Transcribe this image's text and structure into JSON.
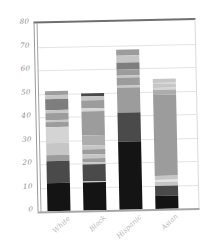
{
  "chart_data": {
    "type": "bar",
    "subtype": "stacked-bar",
    "title": "",
    "xlabel": "",
    "ylabel": "",
    "categories": [
      "White",
      "Black",
      "Hispanic",
      "Asian"
    ],
    "y_axis": {
      "min": 0,
      "max": 80,
      "tick_step": 10,
      "tick_labels": [
        "80",
        "70",
        "60",
        "50",
        "40",
        "30",
        "20",
        "10",
        "0"
      ]
    },
    "grid": true,
    "legend": false,
    "totals": [
      51.1,
      49.9,
      68.2,
      55.5
    ],
    "palette": {
      "black": "#141414",
      "darkGray": "#4a4a4a",
      "midDark": "#7e7e7e",
      "gray": "#9c9c9c",
      "lightMid": "#adadad",
      "lightGray": "#c6c6c6",
      "pale": "#d4d4d4",
      "nearWhite": "#e4e4e4"
    },
    "bars": [
      {
        "category": "White",
        "segments": [
          {
            "value": 12.0,
            "shade": "black"
          },
          {
            "value": 9.5,
            "shade": "darkGray"
          },
          {
            "value": 2.3,
            "shade": "gray"
          },
          {
            "value": 5.2,
            "shade": "lightGray"
          },
          {
            "value": 6.8,
            "shade": "pale"
          },
          {
            "value": 2.1,
            "shade": "gray"
          },
          {
            "value": 0.9,
            "shade": "lightGray"
          },
          {
            "value": 2.9,
            "shade": "gray"
          },
          {
            "value": 1.5,
            "shade": "lightGray"
          },
          {
            "value": 4.5,
            "shade": "midDark"
          },
          {
            "value": 1.7,
            "shade": "lightGray"
          },
          {
            "value": 1.7,
            "shade": "gray"
          }
        ]
      },
      {
        "category": "Black",
        "segments": [
          {
            "value": 11.9,
            "shade": "black"
          },
          {
            "value": 0.6,
            "shade": "lightGray"
          },
          {
            "value": 7.1,
            "shade": "darkGray"
          },
          {
            "value": 0.9,
            "shade": "lightGray"
          },
          {
            "value": 1.7,
            "shade": "gray"
          },
          {
            "value": 1.7,
            "shade": "lightGray"
          },
          {
            "value": 2.1,
            "shade": "gray"
          },
          {
            "value": 1.7,
            "shade": "lightGray"
          },
          {
            "value": 4.3,
            "shade": "lightMid"
          },
          {
            "value": 10.3,
            "shade": "gray"
          },
          {
            "value": 0.9,
            "shade": "pale"
          },
          {
            "value": 3.5,
            "shade": "gray"
          },
          {
            "value": 1.7,
            "shade": "lightGray"
          },
          {
            "value": 1.5,
            "shade": "darkGray"
          }
        ]
      },
      {
        "category": "Hispanic",
        "segments": [
          {
            "value": 28.8,
            "shade": "black"
          },
          {
            "value": 12.7,
            "shade": "darkGray"
          },
          {
            "value": 10.3,
            "shade": "gray"
          },
          {
            "value": 0.9,
            "shade": "lightGray"
          },
          {
            "value": 3.4,
            "shade": "gray"
          },
          {
            "value": 0.9,
            "shade": "lightGray"
          },
          {
            "value": 2.8,
            "shade": "gray"
          },
          {
            "value": 2.9,
            "shade": "midDark"
          },
          {
            "value": 2.9,
            "shade": "lightGray"
          },
          {
            "value": 2.6,
            "shade": "gray"
          }
        ]
      },
      {
        "category": "Asian",
        "segments": [
          {
            "value": 5.4,
            "shade": "black"
          },
          {
            "value": 4.3,
            "shade": "darkGray"
          },
          {
            "value": 1.7,
            "shade": "lightGray"
          },
          {
            "value": 0.9,
            "shade": "nearWhite"
          },
          {
            "value": 1.7,
            "shade": "lightGray"
          },
          {
            "value": 34.7,
            "shade": "gray"
          },
          {
            "value": 2.0,
            "shade": "lightMid"
          },
          {
            "value": 0.6,
            "shade": "pale"
          },
          {
            "value": 1.8,
            "shade": "lightGray"
          },
          {
            "value": 0.4,
            "shade": "pale"
          },
          {
            "value": 2.0,
            "shade": "lightGray"
          }
        ]
      }
    ],
    "frame_colors": {
      "top_border": "#6f6f6f",
      "left_spine": "#9a9a9a",
      "inner_spine": "#a3a3a3",
      "right_border": "#dadada",
      "x_axis": "#a6a6a6",
      "gridline": "#e3e3e3",
      "y_tick_label": "#8a8a8a",
      "x_tick_label": "#b8b8b8",
      "background": "#ffffff"
    }
  }
}
